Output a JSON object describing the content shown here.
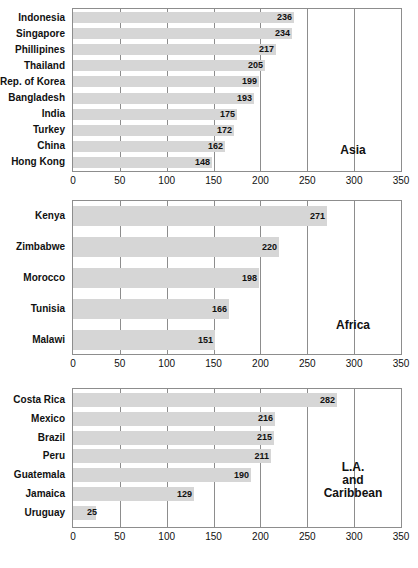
{
  "chart_data": {
    "type": "bar",
    "orientation": "horizontal",
    "title": "",
    "xlabel": "",
    "ylabel": "",
    "xlim": [
      0,
      350
    ],
    "xticks": [
      0,
      50,
      100,
      150,
      200,
      250,
      300,
      350
    ],
    "grid": true,
    "legend": "none",
    "bar_color": "#d6d6d6",
    "panels": [
      {
        "name": "Asia",
        "region_label": [
          "Asia"
        ],
        "categories": [
          "Indonesia",
          "Singapore",
          "Phillipines",
          "Thailand",
          "Rep. of Korea",
          "Bangladesh",
          "India",
          "Turkey",
          "China",
          "Hong Kong"
        ],
        "values": [
          236,
          234,
          217,
          205,
          199,
          193,
          175,
          172,
          162,
          148
        ]
      },
      {
        "name": "Africa",
        "region_label": [
          "Africa"
        ],
        "categories": [
          "Kenya",
          "Zimbabwe",
          "Morocco",
          "Tunisia",
          "Malawi"
        ],
        "values": [
          271,
          220,
          198,
          166,
          151
        ]
      },
      {
        "name": "L.A. and Caribbean",
        "region_label": [
          "L.A.",
          "and",
          "Caribbean"
        ],
        "categories": [
          "Costa Rica",
          "Mexico",
          "Brazil",
          "Peru",
          "Guatemala",
          "Jamaica",
          "Uruguay"
        ],
        "values": [
          282,
          216,
          215,
          211,
          190,
          129,
          25
        ]
      }
    ]
  }
}
